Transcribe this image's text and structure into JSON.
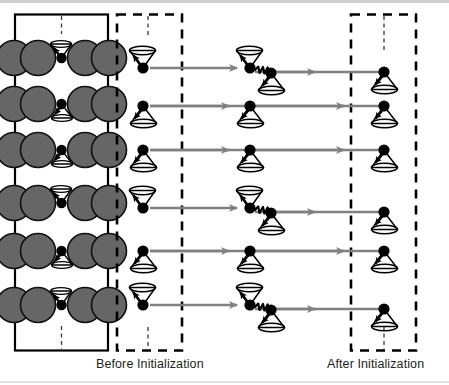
{
  "figure": {
    "type": "schematic-diagram",
    "background_color": "#ffffff",
    "ink_color": "#000000",
    "arrow_color": "#808080",
    "atom_color": "#666666"
  },
  "labels": {
    "before": "Before Initialization",
    "after": "After Initialization"
  },
  "lattice": {
    "name": "crystal-lattice-panel",
    "border_style": "solid",
    "rows": 6,
    "atoms_per_row": 5,
    "atom_color": "#666666",
    "spin_color": "#000000",
    "axis_line_style": "dashed",
    "spin_states": [
      "down",
      "up",
      "up",
      "down",
      "up",
      "down"
    ]
  },
  "panels": [
    {
      "name": "before-initialization-panel",
      "border_style": "dashed",
      "label": "Before Initialization",
      "spin_states": [
        "down",
        "up",
        "up",
        "down",
        "up",
        "down"
      ]
    },
    {
      "name": "interaction-column",
      "border_style": "none",
      "label": "",
      "spin_states": [
        "flip",
        "up",
        "up",
        "flip",
        "up",
        "flip"
      ]
    },
    {
      "name": "after-initialization-panel",
      "border_style": "dashed",
      "label": "After Initialization",
      "spin_states": [
        "up",
        "up",
        "up",
        "up",
        "up",
        "up"
      ]
    }
  ],
  "rows": [
    {
      "index": 1,
      "before": "down",
      "middle": "flip",
      "after": "up",
      "coupling": "zigzag"
    },
    {
      "index": 2,
      "before": "up",
      "middle": "up",
      "after": "up",
      "coupling": "none"
    },
    {
      "index": 3,
      "before": "up",
      "middle": "up",
      "after": "up",
      "coupling": "none"
    },
    {
      "index": 4,
      "before": "down",
      "middle": "flip",
      "after": "up",
      "coupling": "zigzag"
    },
    {
      "index": 5,
      "before": "up",
      "middle": "up",
      "after": "up",
      "coupling": "none"
    },
    {
      "index": 6,
      "before": "down",
      "middle": "flip",
      "after": "up",
      "coupling": "zigzag"
    }
  ],
  "icons": {
    "spin_up": "spin-cone-up-icon",
    "spin_down": "spin-cone-down-icon",
    "arrow": "right-arrow-icon",
    "coupling": "zigzag-spring-icon",
    "axis": "dashed-axis-icon"
  }
}
